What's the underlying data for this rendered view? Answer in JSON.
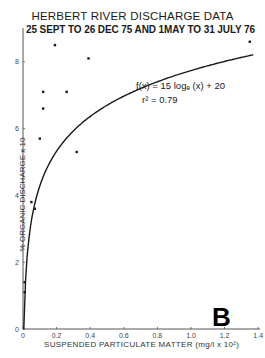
{
  "chart_data": {
    "type": "scatter",
    "title": "HERBERT RIVER DISCHARGE DATA",
    "subtitle": "25 SEPT TO 26 DEC 75 AND 1MAY TO 31 JULY 76",
    "xlabel": "SUSPENDED PARTICULATE MATTER (mg/l x 10²)",
    "ylabel": "% ORGANIC DISCHARGE x 10",
    "panel_label": "B",
    "xlim": [
      0,
      1.4
    ],
    "ylim": [
      0,
      9
    ],
    "x_ticks": [
      0,
      0.2,
      0.4,
      0.6,
      0.8,
      1.0,
      1.2,
      1.4
    ],
    "x_tick_labels": [
      "0",
      "0.2",
      "0.4",
      "0.6",
      "0.8",
      "1.0",
      "1.2",
      "1.4"
    ],
    "y_ticks": [
      0,
      2,
      4,
      6,
      8
    ],
    "y_tick_labels": [
      "0",
      "2",
      "4",
      "6",
      "8"
    ],
    "grid": false,
    "series": [
      {
        "name": "observations",
        "type": "scatter",
        "points": [
          {
            "x": 0.01,
            "y": 1.4
          },
          {
            "x": 0.01,
            "y": 1.1
          },
          {
            "x": 0.05,
            "y": 3.8
          },
          {
            "x": 0.07,
            "y": 3.6
          },
          {
            "x": 0.1,
            "y": 5.7
          },
          {
            "x": 0.12,
            "y": 7.1
          },
          {
            "x": 0.12,
            "y": 6.6
          },
          {
            "x": 0.19,
            "y": 8.5
          },
          {
            "x": 0.26,
            "y": 7.1
          },
          {
            "x": 0.32,
            "y": 5.3
          },
          {
            "x": 0.39,
            "y": 8.1
          },
          {
            "x": 1.35,
            "y": 8.6
          }
        ]
      },
      {
        "name": "fit",
        "type": "line",
        "equation": "f(x) = 15 log_e (x) + 20",
        "r_squared": "0.79"
      }
    ],
    "annotations": [
      "f(x) = 15 log_e (x) + 20",
      "r² = 0.79"
    ]
  },
  "labels": {
    "title": "HERBERT RIVER DISCHARGE DATA",
    "subtitle": "25 SEPT  TO 26 DEC 75 AND 1MAY  TO 31 JULY 76",
    "ylabel": "% ORGANIC DISCHARGE x 10",
    "xlabel": "SUSPENDED PARTICULATE MATTER (mg/l x 10²)",
    "panel": "B",
    "equation": "f(x) = 15 logₑ (x) + 20",
    "r2": "r² = 0.79"
  },
  "colors": {
    "ink": "#1a1a1a",
    "background": "#ffffff"
  }
}
